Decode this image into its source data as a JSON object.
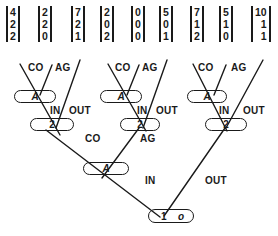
{
  "vectors": [
    {
      "values": [
        "4",
        "2",
        "2"
      ]
    },
    {
      "values": [
        "2",
        "2",
        "0"
      ]
    },
    {
      "values": [
        "7",
        "2",
        "1"
      ]
    },
    {
      "values": [
        "2",
        "0",
        "2"
      ]
    },
    {
      "values": [
        "0",
        "0",
        "0"
      ]
    },
    {
      "values": [
        "5",
        "0",
        "1"
      ]
    },
    {
      "values": [
        "7",
        "1",
        "2"
      ]
    },
    {
      "values": [
        "5",
        "1",
        "0"
      ]
    },
    {
      "values": [
        "10",
        "1",
        "1"
      ]
    }
  ],
  "subtrees": [
    {
      "co": "CO",
      "ag": "AG",
      "in": "IN",
      "out": "OUT",
      "a_node": "A",
      "two_node": "2"
    },
    {
      "co": "CO",
      "ag": "AG",
      "in": "IN",
      "out": "OUT",
      "a_node": "A",
      "two_node": "2"
    },
    {
      "co": "CO",
      "ag": "AG",
      "in": "IN",
      "out": "OUT",
      "a_node": "A",
      "two_node": "2"
    }
  ],
  "lower": {
    "co": "CO",
    "ag": "AG",
    "a_node": "A",
    "in": "IN",
    "out": "OUT"
  },
  "root": {
    "label": "1",
    "sub": "o"
  },
  "colors": {
    "ink": "#1a1a1a",
    "background": "#ffffff"
  }
}
